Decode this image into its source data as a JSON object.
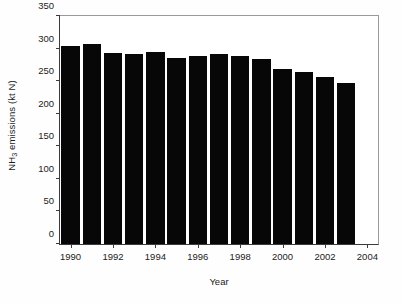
{
  "chart_data": {
    "type": "bar",
    "title": "",
    "xlabel": "Year",
    "ylabel": "NH3 emissions (kt N)",
    "ylabel_prefix": "NH",
    "ylabel_sub": "3",
    "ylabel_suffix": " emissions (kt N)",
    "categories": [
      1990,
      1991,
      1992,
      1993,
      1994,
      1995,
      1996,
      1997,
      1998,
      1999,
      2000,
      2001,
      2002,
      2003
    ],
    "values": [
      304,
      307,
      293,
      292,
      295,
      286,
      288,
      291,
      288,
      284,
      269,
      264,
      257,
      247
    ],
    "series": [
      {
        "name": "NH3 emissions",
        "values": [
          304,
          307,
          293,
          292,
          295,
          286,
          288,
          291,
          288,
          284,
          269,
          264,
          257,
          247
        ]
      }
    ],
    "ylim": [
      0,
      350
    ],
    "xlim": [
      1989.5,
      2004.5
    ],
    "yticks": [
      0,
      50,
      100,
      150,
      200,
      250,
      300,
      350
    ],
    "ytick_labels": [
      "0",
      "50",
      "100",
      "150",
      "200",
      "250",
      "300",
      "350"
    ],
    "xticks": [
      1990,
      1992,
      1994,
      1996,
      1998,
      2000,
      2002,
      2004
    ],
    "xtick_labels": [
      "1990",
      "1992",
      "1994",
      "1996",
      "1998",
      "2000",
      "2002",
      "2004"
    ],
    "grid": false,
    "legend": false,
    "bar_color": "#070707",
    "axis_color": "#3b3b3b",
    "background_color": "#ffffff"
  }
}
